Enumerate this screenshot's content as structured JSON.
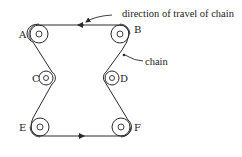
{
  "diagram": {
    "title": "",
    "labels": {
      "direction": "direction of travel of chain",
      "chain": "chain"
    },
    "pulleys": [
      {
        "id": "A",
        "cx": 39,
        "cy": 34,
        "r": 9,
        "label": "A",
        "lx": 18,
        "ly": 38
      },
      {
        "id": "B",
        "cx": 120,
        "cy": 34,
        "r": 9,
        "label": "B",
        "lx": 134,
        "ly": 33
      },
      {
        "id": "C",
        "cx": 46,
        "cy": 78,
        "r": 7,
        "label": "C",
        "lx": 32,
        "ly": 82
      },
      {
        "id": "D",
        "cx": 112,
        "cy": 78,
        "r": 7,
        "label": "D",
        "lx": 120,
        "ly": 82
      },
      {
        "id": "E",
        "cx": 40,
        "cy": 127,
        "r": 9,
        "label": "E",
        "lx": 19,
        "ly": 131
      },
      {
        "id": "F",
        "cx": 121,
        "cy": 127,
        "r": 9,
        "label": "F",
        "lx": 134,
        "ly": 131
      }
    ],
    "colors": {
      "line": "#2a2a2a",
      "text": "#222222",
      "background": "#ffffff"
    }
  }
}
